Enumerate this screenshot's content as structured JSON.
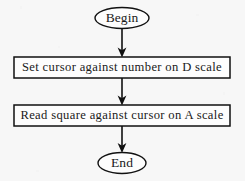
{
  "diagram": {
    "type": "flowchart",
    "orientation": "vertical",
    "colors": {
      "background": "#fdfdfd",
      "stroke": "#111111",
      "text": "#1a1a1a"
    },
    "nodes": [
      {
        "id": "begin",
        "shape": "ellipse",
        "label": "Begin",
        "cx": 122,
        "cy": 18,
        "rx": 27,
        "ry": 10.5
      },
      {
        "id": "set-cursor",
        "shape": "rectangle",
        "label": "Set cursor against number on D scale",
        "x": 14,
        "y": 57,
        "width": 216,
        "height": 21
      },
      {
        "id": "read-square",
        "shape": "rectangle",
        "label": "Read square against cursor on A scale",
        "x": 14,
        "y": 105,
        "width": 216,
        "height": 21
      },
      {
        "id": "end",
        "shape": "ellipse",
        "label": "End",
        "cx": 122,
        "cy": 163,
        "rx": 24,
        "ry": 10.5
      }
    ],
    "connectors": [
      {
        "id": "begin-to-set-cursor",
        "from": "begin",
        "to": "set-cursor",
        "x": 122,
        "y1": 28.5,
        "y2": 57,
        "arrowhead": "down"
      },
      {
        "id": "set-cursor-to-read-square",
        "from": "set-cursor",
        "to": "read-square",
        "x": 122,
        "y1": 78,
        "y2": 105,
        "arrowhead": "down"
      },
      {
        "id": "read-square-to-end",
        "from": "read-square",
        "to": "end",
        "x": 122,
        "y1": 126,
        "y2": 152.5,
        "arrowhead": "down"
      }
    ]
  }
}
